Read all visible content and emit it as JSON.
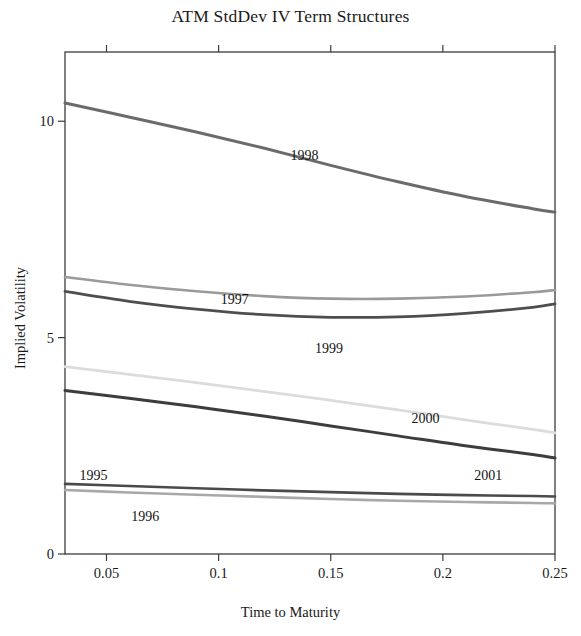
{
  "chart_data": {
    "type": "line",
    "title": "ATM StdDev IV Term Structures",
    "xlabel": "Time to Maturity",
    "ylabel": "Implied Volatility",
    "xlim": [
      0.0315,
      0.25
    ],
    "ylim": [
      0,
      11.6
    ],
    "xticks": [
      0.05,
      0.1,
      0.15,
      0.2,
      0.25
    ],
    "xticklabels": [
      "0.05",
      "0.1",
      "0.15",
      "0.2",
      "0.25"
    ],
    "yticks": [
      0,
      5,
      10
    ],
    "yticklabels": [
      "0",
      "5",
      "10"
    ],
    "grid": false,
    "legend": "inline-labels",
    "x": [
      0.0315,
      0.06,
      0.09,
      0.12,
      0.15,
      0.18,
      0.21,
      0.24,
      0.25
    ],
    "series": [
      {
        "name": "1995",
        "color": "#4a4a4a",
        "width": 2.6,
        "values": [
          1.62,
          1.57,
          1.52,
          1.47,
          1.43,
          1.39,
          1.36,
          1.34,
          1.33
        ],
        "label": "1995",
        "label_x": 0.038,
        "label_y": 1.72
      },
      {
        "name": "1996",
        "color": "#a8a8a8",
        "width": 2.6,
        "values": [
          1.48,
          1.42,
          1.37,
          1.32,
          1.27,
          1.23,
          1.2,
          1.18,
          1.17
        ],
        "label": "1996",
        "label_x": 0.061,
        "label_y": 0.77
      },
      {
        "name": "1997",
        "color": "#9a9a9a",
        "width": 2.6,
        "values": [
          6.4,
          6.22,
          6.07,
          5.96,
          5.9,
          5.9,
          5.95,
          6.05,
          6.1
        ],
        "label": "1997",
        "label_x": 0.101,
        "label_y": 5.78
      },
      {
        "name": "1998",
        "color": "#6b6b6b",
        "width": 3.0,
        "values": [
          10.42,
          10.1,
          9.75,
          9.38,
          8.98,
          8.6,
          8.26,
          7.98,
          7.9
        ],
        "label": "1998",
        "label_x": 0.132,
        "label_y": 9.1
      },
      {
        "name": "1999",
        "color": "#4e4e4e",
        "width": 2.8,
        "values": [
          6.07,
          5.84,
          5.66,
          5.53,
          5.47,
          5.48,
          5.56,
          5.7,
          5.78
        ],
        "label": "1999",
        "label_x": 0.143,
        "label_y": 4.65
      },
      {
        "name": "2000",
        "color": "#dcdcdc",
        "width": 2.8,
        "values": [
          4.33,
          4.15,
          3.96,
          3.76,
          3.55,
          3.33,
          3.1,
          2.88,
          2.8
        ],
        "label": "2000",
        "label_x": 0.186,
        "label_y": 3.02
      },
      {
        "name": "2001",
        "color": "#3d3d3d",
        "width": 3.0,
        "values": [
          3.78,
          3.6,
          3.4,
          3.19,
          2.96,
          2.73,
          2.5,
          2.3,
          2.22
        ],
        "label": "2001",
        "label_x": 0.214,
        "label_y": 1.72
      }
    ]
  },
  "plot_geometry": {
    "left": 65,
    "right": 555,
    "top": 52,
    "bottom": 554
  }
}
